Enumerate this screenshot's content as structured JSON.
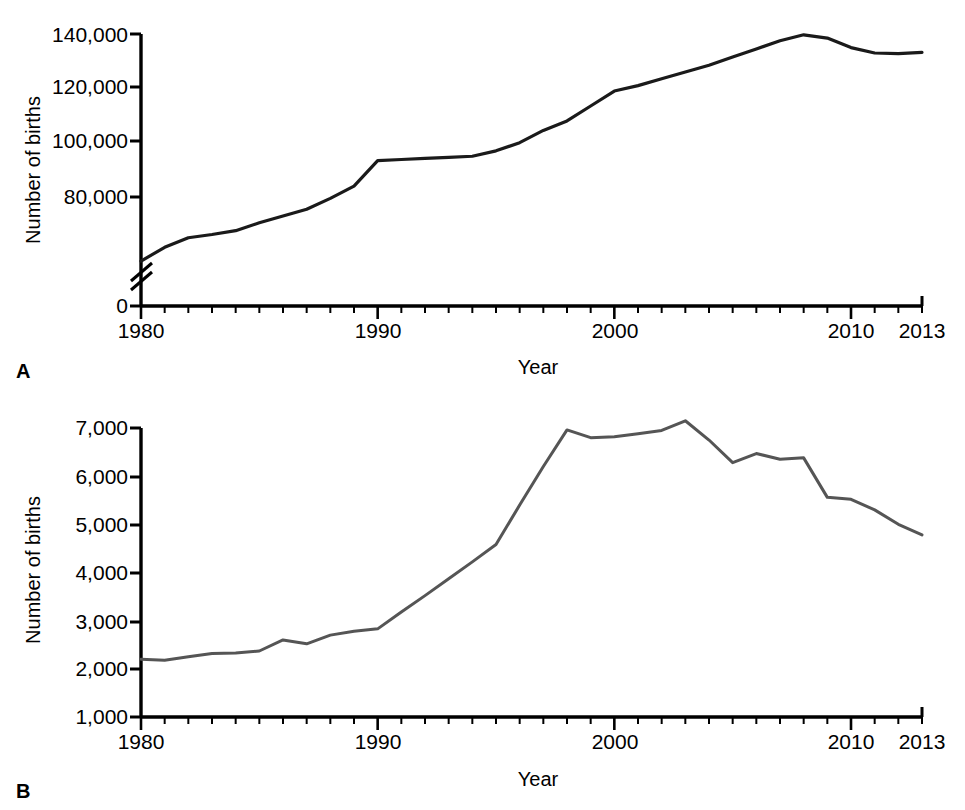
{
  "figure": {
    "background_color": "#ffffff",
    "panels": [
      {
        "letter": "A",
        "ylabel": "Number of births",
        "xlabel": "Year"
      },
      {
        "letter": "B",
        "ylabel": "Number of births",
        "xlabel": "Year"
      }
    ]
  },
  "chart_data": [
    {
      "type": "line",
      "panel": "A",
      "title": "",
      "xlabel": "Year",
      "ylabel": "Number of births",
      "xlim": [
        1980,
        2013
      ],
      "ylim": [
        0,
        140000
      ],
      "y_axis_break": true,
      "y_axis_break_note": "axis broken between 0 and approximately 50,000",
      "xticks": [
        1980,
        1990,
        2000,
        2010,
        2013
      ],
      "xtick_labels": [
        "1980",
        "1990",
        "2000",
        "2010",
        "2013"
      ],
      "xtick_minor_interval": 1,
      "yticks": [
        0,
        80000,
        100000,
        120000,
        140000
      ],
      "ytick_labels": [
        "0",
        "80,000",
        "100,000",
        "120,000",
        "140,000"
      ],
      "grid": false,
      "legend": "none",
      "line_color": "#1a1a1a",
      "line_width": 3.2,
      "x": [
        1980,
        1981,
        1982,
        1983,
        1984,
        1985,
        1986,
        1987,
        1988,
        1989,
        1990,
        1991,
        1992,
        1993,
        1994,
        1995,
        1996,
        1997,
        1998,
        1999,
        2000,
        2001,
        2002,
        2003,
        2004,
        2005,
        2006,
        2007,
        2008,
        2009,
        2010,
        2011,
        2012,
        2013
      ],
      "values": [
        56400,
        61500,
        65000,
        66200,
        67600,
        70500,
        73000,
        75500,
        79500,
        84000,
        93400,
        93800,
        94200,
        94600,
        95000,
        97000,
        100000,
        104500,
        108000,
        113500,
        119000,
        121000,
        123500,
        126000,
        128500,
        131500,
        134500,
        137500,
        139700,
        138500,
        135000,
        133000,
        132800,
        133200
      ]
    },
    {
      "type": "line",
      "panel": "B",
      "title": "",
      "xlabel": "Year",
      "ylabel": "Number of births",
      "xlim": [
        1980,
        2013
      ],
      "ylim": [
        1000,
        7000
      ],
      "y_axis_break": false,
      "xticks": [
        1980,
        1990,
        2000,
        2010,
        2013
      ],
      "xtick_labels": [
        "1980",
        "1990",
        "2000",
        "2010",
        "2013"
      ],
      "xtick_minor_interval": 1,
      "yticks": [
        1000,
        2000,
        3000,
        4000,
        5000,
        6000,
        7000
      ],
      "ytick_labels": [
        "1,000",
        "2,000",
        "3,000",
        "4,000",
        "5,000",
        "6,000",
        "7,000"
      ],
      "grid": false,
      "legend": "none",
      "line_color": "#555555",
      "line_width": 3.0,
      "x": [
        1980,
        1981,
        1982,
        1983,
        1984,
        1985,
        1986,
        1987,
        1988,
        1989,
        1990,
        1991,
        1992,
        1993,
        1994,
        1995,
        1996,
        1997,
        1998,
        1999,
        2000,
        2001,
        2002,
        2003,
        2004,
        2005,
        2006,
        2007,
        2008,
        2009,
        2010,
        2011,
        2012,
        2013
      ],
      "values": [
        2200,
        2180,
        2250,
        2320,
        2330,
        2370,
        2600,
        2520,
        2700,
        2780,
        2830,
        3180,
        3520,
        3870,
        4220,
        4580,
        5400,
        6200,
        6960,
        6800,
        6820,
        6880,
        6950,
        7150,
        6750,
        6280,
        6470,
        6350,
        6380,
        5560,
        5520,
        5300,
        5000,
        4780
      ]
    }
  ]
}
